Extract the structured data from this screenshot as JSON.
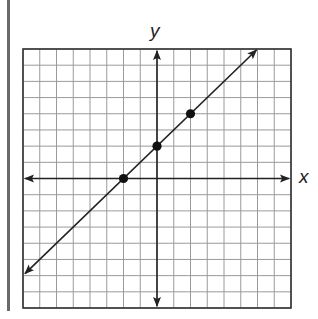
{
  "graph": {
    "x_label": "x",
    "y_label": "y",
    "grid": {
      "x_min": -8,
      "x_max": 8,
      "y_min": -8,
      "y_max": 8,
      "step": 1
    },
    "line": {
      "equation": "y = x + 2",
      "slope": 1,
      "intercept": 2,
      "from": [
        -8,
        -6
      ],
      "to": [
        6,
        8
      ]
    },
    "points": [
      {
        "x": -2,
        "y": 0
      },
      {
        "x": 0,
        "y": 2
      },
      {
        "x": 2,
        "y": 4
      }
    ],
    "colors": {
      "grid": "#9a9a9a",
      "axis": "#222222",
      "border": "#333333",
      "side_bar": "#6a6a6a"
    }
  },
  "chart_data": {
    "type": "line",
    "title": "",
    "xlabel": "x",
    "ylabel": "y",
    "xlim": [
      -8,
      8
    ],
    "ylim": [
      -8,
      8
    ],
    "grid": true,
    "series": [
      {
        "name": "y = x + 2",
        "x": [
          -8,
          6
        ],
        "y": [
          -6,
          8
        ],
        "arrows": "both"
      },
      {
        "name": "plotted points",
        "type": "scatter",
        "x": [
          -2,
          0,
          2
        ],
        "y": [
          0,
          2,
          4
        ]
      }
    ]
  }
}
